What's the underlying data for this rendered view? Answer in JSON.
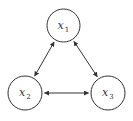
{
  "diagram": {
    "type": "undirected-triangle-graph",
    "colors": {
      "stroke": "#333333",
      "background": "#ffffff",
      "text": "#333333"
    },
    "nodes": [
      {
        "id": "x1",
        "label": "x",
        "subscript": "1",
        "cx": 63.5,
        "cy": 25.5,
        "r": 16.5
      },
      {
        "id": "x2",
        "label": "x",
        "subscript": "2",
        "cx": 25,
        "cy": 93,
        "r": 17
      },
      {
        "id": "x3",
        "label": "x",
        "subscript": "3",
        "cx": 108,
        "cy": 93,
        "r": 17
      }
    ],
    "edges": [
      {
        "from": "x1",
        "to": "x2",
        "arrows": "both"
      },
      {
        "from": "x1",
        "to": "x3",
        "arrows": "both"
      },
      {
        "from": "x2",
        "to": "x3",
        "arrows": "both"
      }
    ]
  }
}
